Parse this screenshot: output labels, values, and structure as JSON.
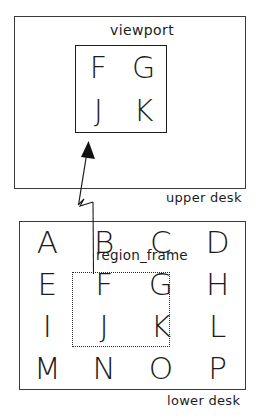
{
  "diagram": {
    "title_hidden": "",
    "colors": {
      "stroke": "#1c1c1c",
      "panel_border": "#3a3a3a",
      "dotted_border": "#2b2b2b",
      "background": "#ffffff"
    },
    "upper_desk": {
      "label": "upper desk",
      "viewport": {
        "label": "viewport",
        "letters": [
          "F",
          "G",
          "J",
          "K"
        ],
        "rows": 2,
        "cols": 2
      }
    },
    "lower_desk": {
      "label": "lower desk",
      "region_frame": {
        "label": "region_frame",
        "letters": [
          "F",
          "G",
          "J",
          "K"
        ],
        "rows": 2,
        "cols": 2
      },
      "grid": {
        "rows": 4,
        "cols": 4,
        "letters": [
          "A",
          "B",
          "C",
          "D",
          "E",
          "F",
          "G",
          "H",
          "I",
          "J",
          "K",
          "L",
          "M",
          "N",
          "O",
          "P"
        ]
      }
    },
    "connector": {
      "name": "region-to-viewport-arrow",
      "direction": "upward"
    }
  }
}
